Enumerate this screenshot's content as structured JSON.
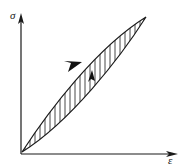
{
  "figure": {
    "kind": "stress-strain-hysteresis-loop",
    "background_color": "#ffffff",
    "stroke_color": "#1a1a1a",
    "hatch_color": "#333333",
    "axes": {
      "y_label": "σ",
      "x_label": "ε",
      "origin": {
        "x": 21,
        "y": 154
      },
      "y_axis_top": {
        "x": 21,
        "y": 14
      },
      "x_axis_right": {
        "x": 178,
        "y": 154
      },
      "arrowheads": [
        "y-axis-arrowhead",
        "x-axis-arrowhead"
      ]
    },
    "loop": {
      "shape": "lens",
      "closed": true,
      "lower_tip": {
        "x": 22,
        "y": 152
      },
      "upper_tip": {
        "x": 146,
        "y": 17
      },
      "upper_branch_control_1": {
        "x": 48,
        "y": 112
      },
      "upper_branch_control_2": {
        "x": 96,
        "y": 48
      },
      "lower_branch_control_1": {
        "x": 70,
        "y": 122
      },
      "lower_branch_control_2": {
        "x": 120,
        "y": 58
      },
      "fill": "vertical-hatching",
      "hatch_count": 27
    },
    "direction_arrows": [
      {
        "name": "upper-branch-direction-arrow",
        "on": "upper-branch",
        "tip": {
          "x": 80,
          "y": 67
        },
        "tail": {
          "x": 68,
          "y": 57
        },
        "meaning": "loading-direction"
      },
      {
        "name": "inner-hatch-direction-arrow",
        "on": "hatch-line",
        "tip": {
          "x": 97,
          "y": 71
        },
        "tail": {
          "x": 88,
          "y": 83
        },
        "meaning": "unloading-direction"
      }
    ]
  }
}
